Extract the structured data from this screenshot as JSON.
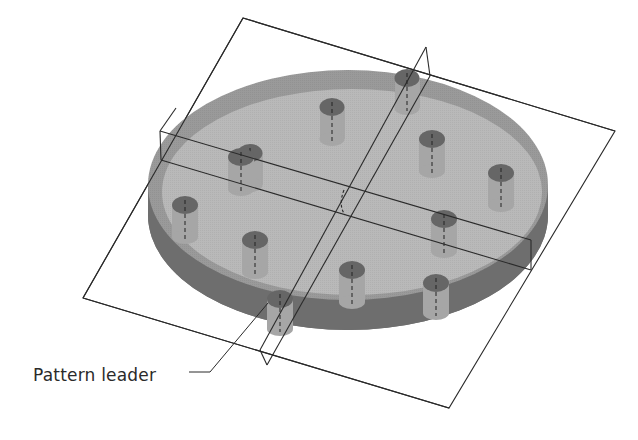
{
  "figure": {
    "type": "cad-isometric-diagram",
    "colors": {
      "background": "#ffffff",
      "disk_top": "#b4b4b4",
      "disk_top_inner": "#bdbdbd",
      "disk_edge": "#707070",
      "disk_rim": "#9a9a9a",
      "peg_top": "#6b6b6b",
      "peg_side": "#a8a8a8",
      "plane_line": "#2a2a2a"
    },
    "pegs": [
      {
        "id": 1,
        "x": 250,
        "y": 153
      },
      {
        "id": 2,
        "x": 332,
        "y": 107
      },
      {
        "id": 3,
        "x": 407,
        "y": 78
      },
      {
        "id": 4,
        "x": 432,
        "y": 139
      },
      {
        "id": 5,
        "x": 501,
        "y": 173
      },
      {
        "id": 6,
        "x": 241,
        "y": 157
      },
      {
        "id": 7,
        "x": 185,
        "y": 205
      },
      {
        "id": 8,
        "x": 255,
        "y": 240
      },
      {
        "id": 9,
        "x": 444,
        "y": 219
      },
      {
        "id": 10,
        "x": 352,
        "y": 270
      },
      {
        "id": 11,
        "x": 436,
        "y": 283
      },
      {
        "id": 12,
        "x": 280,
        "y": 299
      }
    ],
    "callouts": [
      {
        "label": "Pattern leader",
        "target_peg": 12
      }
    ]
  }
}
